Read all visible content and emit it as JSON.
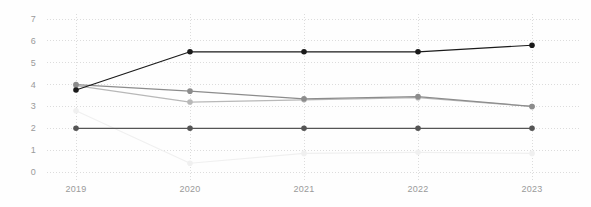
{
  "chart_data": {
    "type": "line",
    "title": "",
    "subtitle": "",
    "xlabel": "",
    "ylabel": "",
    "categories": [
      "2019",
      "2020",
      "2021",
      "2022",
      "2023"
    ],
    "x_tick_labels": [
      "2019",
      "2020",
      "2021",
      "2022",
      "2023"
    ],
    "y_tick_labels": [
      "0",
      "1",
      "2",
      "3",
      "4",
      "5",
      "6",
      "7"
    ],
    "y_tick_values": [
      0,
      1,
      2,
      3,
      4,
      5,
      6,
      7
    ],
    "ylim": [
      0,
      7
    ],
    "grid": "dotted-both-axes",
    "legend": "none",
    "markers": "filled-circles",
    "series": [
      {
        "name": "series-1-black",
        "color": "#1a1a1a",
        "values": [
          3.75,
          5.5,
          5.5,
          5.5,
          5.8
        ]
      },
      {
        "name": "series-2-medium-gray",
        "color": "#8c8c8c",
        "values": [
          4.0,
          3.7,
          3.35,
          3.45,
          3.0
        ]
      },
      {
        "name": "series-3-light-gray",
        "color": "#b8b8b8",
        "values": [
          3.95,
          3.2,
          3.3,
          3.4,
          3.0
        ]
      },
      {
        "name": "series-4-dark-gray",
        "color": "#555555",
        "values": [
          2.0,
          2.0,
          2.0,
          2.0,
          2.0
        ]
      },
      {
        "name": "series-5-very-faint",
        "color": "#f0f0f0",
        "values": [
          2.8,
          0.4,
          0.85,
          0.9,
          0.85
        ]
      }
    ],
    "colors": {
      "gridline": "#dcdcdc",
      "axis_text": "#9a9a9a",
      "background": "#fefefe"
    }
  }
}
